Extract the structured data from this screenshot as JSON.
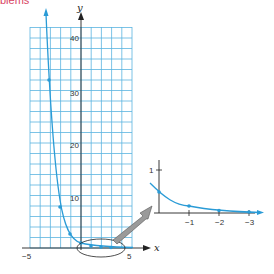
{
  "header": {
    "text": "blems"
  },
  "colors": {
    "grid": "#5ab4e0",
    "curve": "#2a9bd6",
    "axis": "#222222",
    "arrow": "#888888"
  },
  "chart_data": [
    {
      "type": "line",
      "title": "",
      "function": "y = (1/3)^x",
      "xlabel": "x",
      "ylabel": "y",
      "xlim": [
        -5,
        5
      ],
      "ylim": [
        0,
        42
      ],
      "grid": true,
      "x_tick_labels": [
        "-5",
        "5"
      ],
      "y_tick_labels": [
        "10",
        "20",
        "30",
        "40"
      ],
      "x": [
        -3,
        -2,
        -1,
        0,
        1,
        2,
        3
      ],
      "y": [
        27,
        9,
        3,
        1,
        0.33,
        0.11,
        0.04
      ],
      "annotations": [
        "ellipse around region near origin",
        "arrow pointing to enlarged inset"
      ]
    },
    {
      "type": "line",
      "title": "inset (magnified)",
      "xlabel": "",
      "ylabel": "",
      "y_tick_labels": [
        "1"
      ],
      "x_tick_labels": [
        "-1",
        "-2",
        "-3"
      ],
      "x": [
        0,
        1,
        2,
        3
      ],
      "y": [
        0.67,
        0.33,
        0.11,
        0.04
      ],
      "grid": false
    }
  ],
  "labels": {
    "y_axis": "y",
    "x_axis": "x",
    "x_min": "−5",
    "x_max": "5",
    "y_10": "10",
    "y_20": "20",
    "y_30": "30",
    "y_40": "40",
    "inset_y1": "1",
    "inset_x1": "−1",
    "inset_x2": "−2",
    "inset_x3": "−3"
  }
}
